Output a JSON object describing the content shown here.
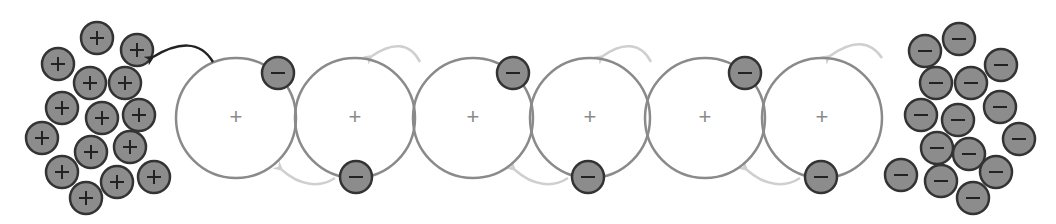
{
  "diagram": {
    "colors": {
      "background": "#ffffff",
      "atom_stroke": "#8a8a8a",
      "atom_plus": "#8a8a8a",
      "particle_fill": "#8c8c8c",
      "particle_stroke": "#333333",
      "particle_sign": "#222222",
      "dark_arrow": "#222222",
      "light_arrow": "#cfcfcf"
    },
    "atom_radius": 60,
    "particle_radius": 16,
    "atoms": [
      {
        "cx": 236,
        "cy": 118,
        "sign": "+",
        "electron": {
          "cx": 278,
          "cy": 73
        }
      },
      {
        "cx": 355,
        "cy": 118,
        "sign": "+",
        "electron": {
          "cx": 356,
          "cy": 177
        }
      },
      {
        "cx": 473,
        "cy": 118,
        "sign": "+",
        "electron": {
          "cx": 513,
          "cy": 73
        }
      },
      {
        "cx": 590,
        "cy": 118,
        "sign": "+",
        "electron": {
          "cx": 588,
          "cy": 177
        }
      },
      {
        "cx": 705,
        "cy": 118,
        "sign": "+",
        "electron": {
          "cx": 745,
          "cy": 73
        }
      },
      {
        "cx": 822,
        "cy": 118,
        "sign": "+",
        "electron": {
          "cx": 821,
          "cy": 177
        }
      }
    ],
    "positive_cluster": {
      "sign": "+",
      "particles": [
        [
          97,
          38
        ],
        [
          137,
          50
        ],
        [
          58,
          64
        ],
        [
          90,
          83
        ],
        [
          125,
          83
        ],
        [
          62,
          108
        ],
        [
          102,
          118
        ],
        [
          139,
          115
        ],
        [
          42,
          138
        ],
        [
          91,
          152
        ],
        [
          130,
          147
        ],
        [
          62,
          172
        ],
        [
          117,
          182
        ],
        [
          154,
          177
        ],
        [
          86,
          198
        ]
      ]
    },
    "negative_cluster": {
      "sign": "−",
      "particles": [
        [
          959,
          39
        ],
        [
          925,
          51
        ],
        [
          1001,
          65
        ],
        [
          936,
          83
        ],
        [
          971,
          83
        ],
        [
          921,
          115
        ],
        [
          958,
          120
        ],
        [
          1000,
          107
        ],
        [
          1019,
          139
        ],
        [
          937,
          148
        ],
        [
          969,
          154
        ],
        [
          901,
          175
        ],
        [
          941,
          181
        ],
        [
          996,
          172
        ],
        [
          973,
          198
        ]
      ]
    },
    "arrows": {
      "dark": {
        "path": "M213,62 C200,40 178,42 153,57",
        "head": [
          153,
          57
        ]
      },
      "light": [
        {
          "path": "M420,62 C410,42 392,42 372,56",
          "head": [
            372,
            56
          ]
        },
        {
          "path": "M651,62 C641,42 622,42 603,56",
          "head": [
            603,
            56
          ]
        },
        {
          "path": "M882,58 C870,40 852,40 830,56",
          "head": [
            830,
            56
          ]
        },
        {
          "path": "M335,178 C320,188 300,186 282,170",
          "head": [
            282,
            170
          ]
        },
        {
          "path": "M568,178 C553,188 533,186 515,170",
          "head": [
            515,
            170
          ]
        },
        {
          "path": "M800,178 C785,188 765,186 747,170",
          "head": [
            747,
            170
          ]
        }
      ]
    }
  }
}
